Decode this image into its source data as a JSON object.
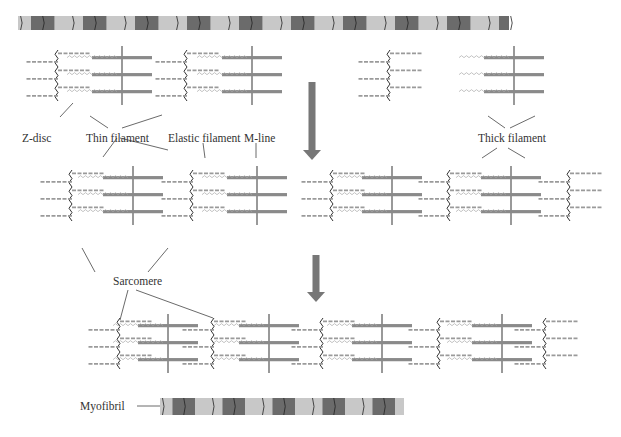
{
  "labels": {
    "z_disc": "Z-disc",
    "thin_filament": "Thin filament",
    "elastic_filament": "Elastic filament",
    "m_line": "M-line",
    "thick_filament": "Thick filament",
    "sarcomere": "Sarcomere",
    "myofibril": "Myofibril"
  },
  "colors": {
    "dark_band": "#6b6b6b",
    "light_band": "#c8c8c8",
    "arrow": "#777777",
    "thick": "#8a8a8a",
    "thin": "#9a9a9a",
    "line": "#444444"
  },
  "top_band": {
    "x": 18,
    "y": 16,
    "width": 491,
    "height": 14,
    "period": 52
  },
  "panels": [
    {
      "name": "relaxed",
      "y": 50,
      "zdiscs": [
        58,
        187,
        390
      ],
      "mlines": [
        122,
        252,
        514
      ]
    },
    {
      "name": "contracted-1",
      "y": 170,
      "zdiscs": [
        72,
        193,
        333,
        450,
        570
      ],
      "mlines": [
        133,
        257,
        392,
        511
      ]
    },
    {
      "name": "contracted-2",
      "y": 318,
      "zdiscs": [
        120,
        214,
        323,
        440,
        546
      ],
      "mlines": [
        168,
        269,
        382,
        502
      ]
    }
  ],
  "arrows": [
    {
      "x": 312,
      "y1": 82,
      "y2": 160
    },
    {
      "x": 316,
      "y1": 255,
      "y2": 302
    }
  ],
  "myofibril_band": {
    "x": 160,
    "y": 398,
    "width": 244,
    "height": 17,
    "period": 50
  }
}
